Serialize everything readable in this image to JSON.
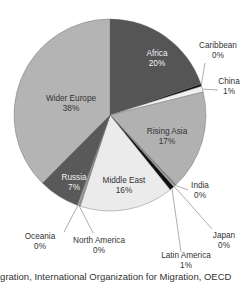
{
  "chart_data": {
    "type": "pie",
    "title": "",
    "start": "12 o'clock, clockwise",
    "slices": [
      {
        "label": "Africa",
        "value": 20,
        "display": "20%",
        "color": "#555555",
        "label_pos": "inside",
        "label_color": "light"
      },
      {
        "label": "Caribbean",
        "value": 0.4,
        "display": "0%",
        "color": "#111111",
        "label_pos": "outside"
      },
      {
        "label": "China",
        "value": 1,
        "display": "1%",
        "color": "#f0f0f0",
        "label_pos": "outside"
      },
      {
        "label": "Rising Asia",
        "value": 17,
        "display": "17%",
        "color": "#b1b1b1",
        "label_pos": "inside",
        "label_color": "dark"
      },
      {
        "label": "India",
        "value": 0.3,
        "display": "0%",
        "color": "#8a8a8a",
        "label_pos": "outside"
      },
      {
        "label": "Japan",
        "value": 0.2,
        "display": "0%",
        "color": "#d0d0d0",
        "label_pos": "outside"
      },
      {
        "label": "Latin America",
        "value": 0.8,
        "display": "1%",
        "color": "#111111",
        "label_pos": "outside"
      },
      {
        "label": "Middle East",
        "value": 16,
        "display": "16%",
        "color": "#ebebeb",
        "label_pos": "inside",
        "label_color": "dark"
      },
      {
        "label": "North America",
        "value": 0.3,
        "display": "0%",
        "color": "#9a9a9a",
        "label_pos": "outside"
      },
      {
        "label": "Oceania",
        "value": 0.2,
        "display": "0%",
        "color": "#cfcfcf",
        "label_pos": "outside"
      },
      {
        "label": "Russia",
        "value": 7,
        "display": "7%",
        "color": "#595959",
        "label_pos": "inside",
        "label_color": "light"
      },
      {
        "label": "Wider Europe",
        "value": 38,
        "display": "38%",
        "color": "#b4b4b4",
        "label_pos": "inside",
        "label_color": "dark"
      }
    ],
    "legend": "none"
  },
  "caption": "igration, International Organization for Migration, OECD"
}
